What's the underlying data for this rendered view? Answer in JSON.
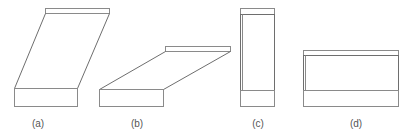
{
  "figure": {
    "panels": [
      {
        "id": "a",
        "label": "(a)",
        "description": "block sheared strongly to the right (tall parallelogram)"
      },
      {
        "id": "b",
        "label": "(b)",
        "description": "block sheared and flattened (low parallelogram)"
      },
      {
        "id": "c",
        "label": "(c)",
        "description": "tall upright rectangular block"
      },
      {
        "id": "d",
        "label": "(d)",
        "description": "wide upright rectangular block"
      }
    ],
    "colors": {
      "line": "#8a8a8a",
      "line_dark": "#6e6e6e",
      "label": "#555555",
      "background": "#ffffff"
    }
  }
}
